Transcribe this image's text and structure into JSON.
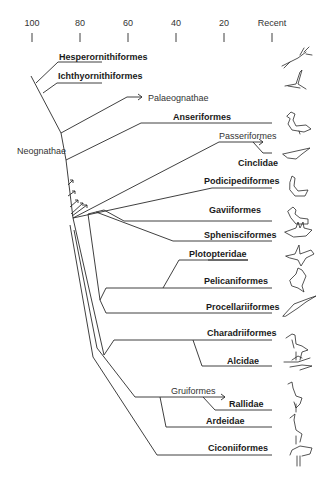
{
  "axis": {
    "ticks": [
      {
        "label": "100",
        "x": 32
      },
      {
        "label": "80",
        "x": 80
      },
      {
        "label": "60",
        "x": 128
      },
      {
        "label": "40",
        "x": 176
      },
      {
        "label": "20",
        "x": 224
      },
      {
        "label": "Recent",
        "x": 272
      }
    ],
    "unit": "million years ago (implied)"
  },
  "taxa": {
    "hesperornithiformes": "Hesperornithiformes",
    "ichthyornithiformes": "Ichthyornithiformes",
    "palaeognathae": "Palaeognathae",
    "neognathae": "Neognathae",
    "anseriformes": "Anseriformes",
    "passeriformes": "Passeriformes",
    "cinclidae": "Cinclidae",
    "podicipediformes": "Podicipediformes",
    "gaviiformes": "Gaviiformes",
    "sphenisciformes": "Sphenisciformes",
    "plotopteridae": "Plotopteridae",
    "pelicaniformes": "Pelicaniformes",
    "procellariiformes": "Procellariiformes",
    "charadriiformes": "Charadriiformes",
    "alcidae": "Alcidae",
    "gruiformes": "Gruiformes",
    "rallidae": "Rallidae",
    "ardeidae": "Ardeidae",
    "ciconiiformes": "Ciconiiformes"
  },
  "icons": [
    "hesperornis-bird-icon",
    "ichthyornis-bird-icon",
    "duck-icon",
    "dipper-icon",
    "grebe-icon",
    "loon-icon",
    "penguin-icon",
    "plotopterid-icon",
    "pelican-icon",
    "albatross-icon",
    "shorebird-icon",
    "auk-icon",
    "rail-icon",
    "heron-icon",
    "ibis-icon"
  ]
}
